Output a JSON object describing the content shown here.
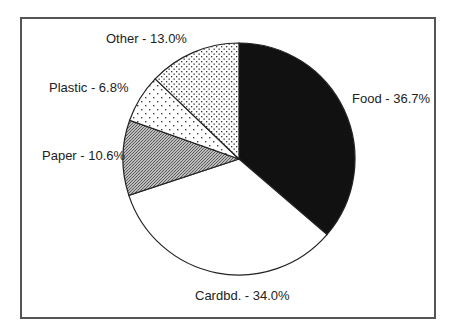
{
  "chart_data": {
    "type": "pie",
    "title": "",
    "start_angle_deg": 0,
    "direction": "clockwise",
    "categories": [
      "Food",
      "Cardbd.",
      "Paper",
      "Plastic",
      "Other"
    ],
    "values": [
      36.7,
      34.0,
      10.6,
      6.8,
      13.0
    ],
    "unit": "%",
    "labels": [
      "Food - 36.7%",
      "Cardbd. - 34.0%",
      "Paper - 10.6%",
      "Plastic - 6.8%",
      "Other - 13.0%"
    ],
    "fills": [
      "solid-black",
      "white",
      "gray-crosshatch",
      "sparse-dots",
      "dense-dots"
    ],
    "legend": "none (labels placed outside slices)"
  }
}
